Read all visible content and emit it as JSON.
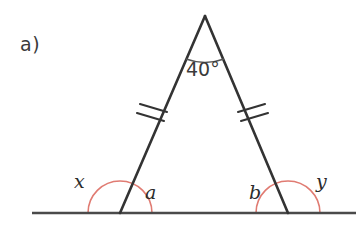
{
  "figure": {
    "part_label": "a)",
    "type": "isosceles-triangle-exterior-angles",
    "background_color": "#ffffff",
    "line_color": "#333333",
    "baseline_color": "#4a4a4a",
    "arc_color_red": "#e07b72",
    "arc_color_dark": "#555555",
    "text_color": "#2b2b2b"
  },
  "apex": {
    "angle_label": "40°",
    "angle_degrees": 40,
    "x": 205,
    "y": 16
  },
  "vertices": {
    "apex": {
      "x": 205,
      "y": 16
    },
    "base_left": {
      "x": 120,
      "y": 213
    },
    "base_right": {
      "x": 288,
      "y": 213
    }
  },
  "baseline": {
    "x_start": 32,
    "x_end": 356,
    "y": 213
  },
  "tick_marks": {
    "count_per_side": 2,
    "left": {
      "x": 153,
      "y": 111
    },
    "right": {
      "x": 251,
      "y": 111
    }
  },
  "angle_labels": [
    {
      "id": "x",
      "label": "x",
      "position": "exterior-left",
      "x": 74,
      "y": 172
    },
    {
      "id": "a",
      "label": "a",
      "position": "interior-left",
      "x": 145,
      "y": 183
    },
    {
      "id": "b",
      "label": "b",
      "position": "interior-right",
      "x": 249,
      "y": 183
    },
    {
      "id": "y",
      "label": "y",
      "position": "exterior-right",
      "x": 316,
      "y": 172
    }
  ],
  "arcs": {
    "apex_arc_radius": 45,
    "base_arc_radius": 32
  }
}
